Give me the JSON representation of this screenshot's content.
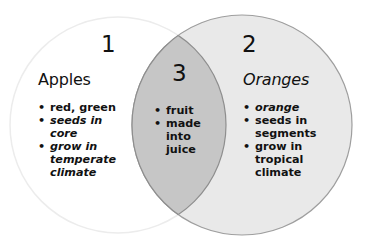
{
  "diagram": {
    "type": "venn",
    "colors": {
      "background": "#ffffff",
      "left_circle_fill": "#ffffff",
      "left_circle_stroke": "#eeeeee",
      "right_circle_fill": "#e8e8e8",
      "right_circle_stroke": "#9a9a9a",
      "overlap_fill": "#c4c4c4",
      "overlap_stroke": "#8c8c8c",
      "text": "#111111"
    },
    "regions": [
      {
        "number": "1",
        "title": "Apples",
        "items": [
          "red, green",
          "seeds in\ncore",
          "grow in\ntemperate\nclimate"
        ]
      },
      {
        "number": "2",
        "title": "Oranges",
        "items": [
          "orange",
          "seeds in\nsegments",
          "grow in\ntropical\nclimate"
        ]
      },
      {
        "number": "3",
        "title": "",
        "items": [
          "fruit",
          "made\ninto\njuice"
        ]
      }
    ]
  }
}
